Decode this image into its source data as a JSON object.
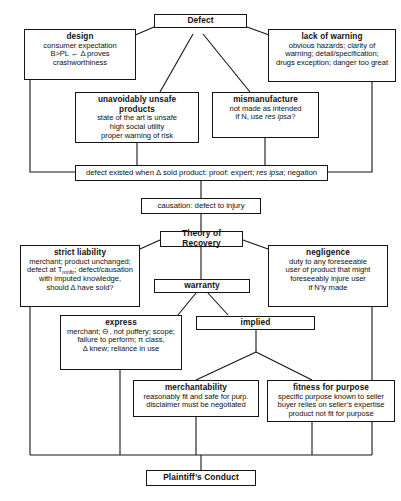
{
  "diagram": {
    "type": "flowchart",
    "nodes": {
      "defect": {
        "header": "Defect",
        "lines": []
      },
      "design": {
        "header": "design",
        "lines": [
          "consumer expectation",
          "B>PL ← Δ proves",
          "crashworthiness"
        ]
      },
      "lack_of_warning": {
        "header": "lack of warning",
        "lines": [
          "obvious hazards; clarity of",
          "warning; detail/specification;",
          "drugs exception; danger too great"
        ]
      },
      "unavoidably_unsafe": {
        "header": "unavoidably unsafe products",
        "lines": [
          "state of the art is unsafe",
          "high social utility",
          "proper warning of risk"
        ]
      },
      "mismanufacture": {
        "header": "mismanufacture",
        "lines": [
          "not made as intended",
          "if N, use res ipsa?"
        ]
      },
      "defect_existed": {
        "header": "",
        "lines": [
          "defect existed when Δ sold product: proof: expert; res ipsa; negation"
        ]
      },
      "causation": {
        "header": "",
        "lines": [
          "causation: defect to injury"
        ]
      },
      "theory_of_recovery": {
        "header": "Theory of Recovery",
        "lines": []
      },
      "strict_liability": {
        "header": "strict liability",
        "lines": [
          "merchant; product unchanged;",
          "defect at T mnftr; defect/causation",
          "with imputed knowledge,",
          "should Δ have sold?"
        ]
      },
      "negligence": {
        "header": "negligence",
        "lines": [
          "duty to any foreseeable",
          "user of product that might",
          "foreseeably injure user",
          "if N'ly made"
        ]
      },
      "warranty": {
        "header": "warranty",
        "lines": []
      },
      "express": {
        "header": "express",
        "lines": [
          "merchant; ⊖, not puffery; scope;",
          "failure to perform; π class,",
          "Δ knew; reliance in use"
        ]
      },
      "implied": {
        "header": "implied",
        "lines": []
      },
      "merchantability": {
        "header": "merchantability",
        "lines": [
          "reasonably fit and safe for purp.",
          "disclaimer must be negotiated"
        ]
      },
      "fitness_for_purpose": {
        "header": "fitness for purpose",
        "lines": [
          "specific purpose known to seller",
          "buyer relies on seller’s expertise",
          "product not fit for purpose"
        ]
      },
      "plaintiffs_conduct": {
        "header": "Plaintiff’s Conduct",
        "lines": []
      }
    },
    "colors": {
      "stroke": "#151515",
      "fill": "#ffffff",
      "text": "#111111"
    }
  }
}
